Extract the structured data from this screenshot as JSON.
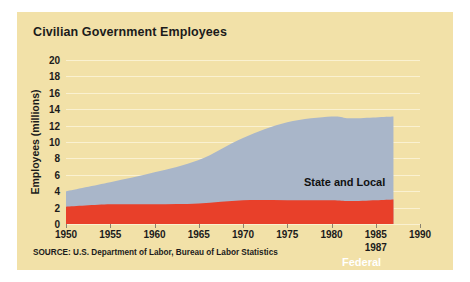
{
  "chart_data": {
    "type": "area",
    "stacked": true,
    "title": "Civilian Government Employees",
    "xlabel": "",
    "ylabel": "Employees (millions)",
    "xlim": [
      1950,
      1990
    ],
    "ylim": [
      0,
      20
    ],
    "xticks": [
      1950,
      1955,
      1960,
      1965,
      1970,
      1975,
      1980,
      1985,
      1990
    ],
    "xtick_labels": [
      "1950",
      "1955",
      "1960",
      "1965",
      "1970",
      "1975",
      "1980",
      "1985",
      "1990"
    ],
    "end_year_annotation": "1987",
    "yticks": [
      0,
      2,
      4,
      6,
      8,
      10,
      12,
      14,
      16,
      18,
      20
    ],
    "ytick_labels": [
      "0",
      "2",
      "4",
      "6",
      "8",
      "10",
      "12",
      "14",
      "16",
      "18",
      "20"
    ],
    "grid": true,
    "legend_position": "inline",
    "x": [
      1950,
      1955,
      1960,
      1965,
      1970,
      1975,
      1980,
      1982,
      1985,
      1987
    ],
    "series": [
      {
        "name": "Federal",
        "color": "#e8402a",
        "label_color": "#ffffff",
        "values": [
          2.1,
          2.4,
          2.4,
          2.5,
          2.9,
          2.9,
          2.9,
          2.8,
          2.9,
          3.0
        ]
      },
      {
        "name": "State and Local",
        "color": "#a9b6c9",
        "label_color": "#111111",
        "values": [
          1.9,
          2.7,
          3.9,
          5.3,
          7.6,
          9.5,
          10.2,
          10.1,
          10.1,
          10.1
        ]
      }
    ],
    "totals": [
      4.0,
      5.1,
      6.3,
      7.8,
      10.5,
      12.4,
      13.1,
      12.9,
      13.0,
      13.1
    ],
    "source": "SOURCE: U.S. Department of Labor, Bureau of Labor Statistics",
    "colors": {
      "panel_background": "#f2e1a8",
      "page_background": "#ffffff",
      "federal": "#e8402a",
      "state_and_local": "#a9b6c9",
      "gridline": "#fbf3d8",
      "text": "#1b1b1b"
    }
  }
}
